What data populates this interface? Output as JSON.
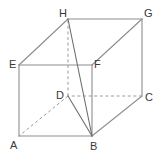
{
  "figure": {
    "kind": "geometry-diagram",
    "canvas": {
      "width": 159,
      "height": 156,
      "background": "#ffffff"
    },
    "colors": {
      "solid_edge": "#8d8d8d",
      "solid_edge_dark": "#6e6e6e",
      "hidden_edge": "#9a9a9a",
      "label_text": "#3a3a3a"
    },
    "vertices": [
      {
        "name": "A",
        "label": "A",
        "x": 19,
        "y": 136,
        "label_x": 10,
        "label_y": 140
      },
      {
        "name": "B",
        "label": "B",
        "x": 92,
        "y": 136,
        "label_x": 90,
        "label_y": 141
      },
      {
        "name": "C",
        "label": "C",
        "x": 142,
        "y": 96,
        "label_x": 145,
        "label_y": 92
      },
      {
        "name": "D",
        "label": "D",
        "x": 68,
        "y": 96,
        "label_x": 56,
        "label_y": 90
      },
      {
        "name": "E",
        "label": "E",
        "x": 19,
        "y": 65,
        "label_x": 9,
        "label_y": 59
      },
      {
        "name": "F",
        "label": "F",
        "x": 92,
        "y": 65,
        "label_x": 94,
        "label_y": 59
      },
      {
        "name": "G",
        "label": "G",
        "x": 142,
        "y": 19,
        "label_x": 144,
        "label_y": 8
      },
      {
        "name": "H",
        "label": "H",
        "x": 68,
        "y": 19,
        "label_x": 59,
        "label_y": 8
      }
    ],
    "edges": [
      {
        "name": "edge-A-B",
        "from": "A",
        "to": "B",
        "style": "solid"
      },
      {
        "name": "edge-B-C",
        "from": "B",
        "to": "C",
        "style": "solid"
      },
      {
        "name": "edge-C-D",
        "from": "C",
        "to": "D",
        "style": "dashed"
      },
      {
        "name": "edge-D-A",
        "from": "D",
        "to": "A",
        "style": "dashed"
      },
      {
        "name": "edge-E-F",
        "from": "E",
        "to": "F",
        "style": "solid"
      },
      {
        "name": "edge-F-G",
        "from": "F",
        "to": "G",
        "style": "solid"
      },
      {
        "name": "edge-G-H",
        "from": "G",
        "to": "H",
        "style": "solid"
      },
      {
        "name": "edge-H-E",
        "from": "H",
        "to": "E",
        "style": "solid"
      },
      {
        "name": "edge-A-E",
        "from": "A",
        "to": "E",
        "style": "solid"
      },
      {
        "name": "edge-B-F",
        "from": "B",
        "to": "F",
        "style": "solid"
      },
      {
        "name": "edge-C-G",
        "from": "C",
        "to": "G",
        "style": "solid"
      },
      {
        "name": "edge-D-H",
        "from": "D",
        "to": "H",
        "style": "dashed"
      }
    ],
    "diagonals": [
      {
        "name": "diagonal-D-B",
        "from": "D",
        "to": "B",
        "style": "solid"
      },
      {
        "name": "diagonal-H-B",
        "from": "H",
        "to": "B",
        "style": "solid"
      }
    ]
  }
}
